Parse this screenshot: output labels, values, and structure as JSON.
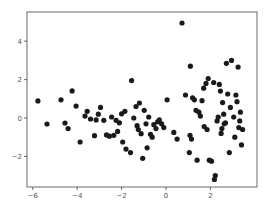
{
  "chart_data": {
    "type": "scatter",
    "title": "",
    "xlabel": "",
    "ylabel": "",
    "xlim": [
      -6.3,
      4.1
    ],
    "ylim": [
      -3.6,
      5.6
    ],
    "xticks": [
      -6,
      -4,
      -2,
      0,
      2
    ],
    "yticks": [
      -2,
      0,
      2,
      4
    ],
    "xtick_labels": [
      "−6",
      "−4",
      "−2",
      "0",
      "2"
    ],
    "ytick_labels": [
      "−2",
      "0",
      "2",
      "4"
    ],
    "grid": false,
    "legend": null,
    "marker_color": "#1a1a1a",
    "points": [
      {
        "x": -5.77,
        "y": 0.89
      },
      {
        "x": -5.36,
        "y": -0.31
      },
      {
        "x": -4.73,
        "y": 0.95
      },
      {
        "x": -4.55,
        "y": -0.26
      },
      {
        "x": -4.41,
        "y": -0.55
      },
      {
        "x": -4.23,
        "y": 1.41
      },
      {
        "x": -4.05,
        "y": 0.62
      },
      {
        "x": -3.87,
        "y": -1.25
      },
      {
        "x": -3.65,
        "y": 0.1
      },
      {
        "x": -3.55,
        "y": 0.35
      },
      {
        "x": -3.4,
        "y": -0.05
      },
      {
        "x": -3.22,
        "y": -0.92
      },
      {
        "x": -3.15,
        "y": -0.1
      },
      {
        "x": -3.05,
        "y": 0.2
      },
      {
        "x": -2.95,
        "y": 0.55
      },
      {
        "x": -2.8,
        "y": -0.12
      },
      {
        "x": -2.68,
        "y": -0.88
      },
      {
        "x": -2.55,
        "y": -0.95
      },
      {
        "x": -2.45,
        "y": 0.05
      },
      {
        "x": -2.35,
        "y": -0.9
      },
      {
        "x": -2.25,
        "y": -0.12
      },
      {
        "x": -2.18,
        "y": -0.7
      },
      {
        "x": -2.1,
        "y": -0.25
      },
      {
        "x": -2.0,
        "y": 0.22
      },
      {
        "x": -1.95,
        "y": -1.25
      },
      {
        "x": -1.85,
        "y": 0.35
      },
      {
        "x": -1.8,
        "y": -1.62
      },
      {
        "x": -1.6,
        "y": -1.8
      },
      {
        "x": -1.55,
        "y": 1.95
      },
      {
        "x": -1.45,
        "y": 0.0
      },
      {
        "x": -1.35,
        "y": 0.6
      },
      {
        "x": -1.3,
        "y": -0.4
      },
      {
        "x": -1.25,
        "y": -0.6
      },
      {
        "x": -1.2,
        "y": 0.78
      },
      {
        "x": -1.12,
        "y": -0.82
      },
      {
        "x": -1.05,
        "y": -2.1
      },
      {
        "x": -0.98,
        "y": 0.4
      },
      {
        "x": -0.9,
        "y": -0.3
      },
      {
        "x": -0.85,
        "y": -1.55
      },
      {
        "x": -0.78,
        "y": 0.05
      },
      {
        "x": -0.7,
        "y": -0.85
      },
      {
        "x": -0.62,
        "y": -1.0
      },
      {
        "x": -0.55,
        "y": -0.35
      },
      {
        "x": -0.45,
        "y": -0.55
      },
      {
        "x": -0.38,
        "y": -0.2
      },
      {
        "x": -0.3,
        "y": -0.1
      },
      {
        "x": -0.2,
        "y": -0.3
      },
      {
        "x": -0.1,
        "y": -0.5
      },
      {
        "x": 0.05,
        "y": 0.95
      },
      {
        "x": 0.35,
        "y": -0.75
      },
      {
        "x": 0.5,
        "y": -1.1
      },
      {
        "x": 0.72,
        "y": 4.95
      },
      {
        "x": 0.88,
        "y": 1.2
      },
      {
        "x": 1.08,
        "y": -0.9
      },
      {
        "x": 1.15,
        "y": -1.1
      },
      {
        "x": 1.4,
        "y": -2.2
      },
      {
        "x": 1.05,
        "y": -1.8
      },
      {
        "x": 1.2,
        "y": 1.05
      },
      {
        "x": 1.28,
        "y": 0.95
      },
      {
        "x": 1.35,
        "y": 0.4
      },
      {
        "x": 1.1,
        "y": 2.7
      },
      {
        "x": 1.48,
        "y": 0.3
      },
      {
        "x": 1.55,
        "y": 0.1
      },
      {
        "x": 1.62,
        "y": 0.9
      },
      {
        "x": 1.7,
        "y": 1.55
      },
      {
        "x": 1.8,
        "y": 1.8
      },
      {
        "x": 1.9,
        "y": 2.05
      },
      {
        "x": 1.72,
        "y": -0.45
      },
      {
        "x": 1.85,
        "y": -0.6
      },
      {
        "x": 1.95,
        "y": -2.2
      },
      {
        "x": 2.05,
        "y": -2.25
      },
      {
        "x": 2.15,
        "y": 1.85
      },
      {
        "x": 2.18,
        "y": -3.2
      },
      {
        "x": 2.22,
        "y": -3.0
      },
      {
        "x": 2.3,
        "y": -0.15
      },
      {
        "x": 2.35,
        "y": 0.05
      },
      {
        "x": 2.4,
        "y": 1.75
      },
      {
        "x": 2.45,
        "y": 1.4
      },
      {
        "x": 2.48,
        "y": -0.8
      },
      {
        "x": 2.52,
        "y": -0.55
      },
      {
        "x": 2.55,
        "y": 0.8
      },
      {
        "x": 2.6,
        "y": 0.2
      },
      {
        "x": 2.62,
        "y": -0.3
      },
      {
        "x": 2.68,
        "y": -0.25
      },
      {
        "x": 2.72,
        "y": 2.85
      },
      {
        "x": 2.78,
        "y": 1.25
      },
      {
        "x": 2.85,
        "y": -1.8
      },
      {
        "x": 2.9,
        "y": 0.55
      },
      {
        "x": 2.95,
        "y": 3.0
      },
      {
        "x": 3.05,
        "y": 0.05
      },
      {
        "x": 3.1,
        "y": -1.0
      },
      {
        "x": 3.15,
        "y": 1.2
      },
      {
        "x": 3.2,
        "y": 0.85
      },
      {
        "x": 3.25,
        "y": 2.65
      },
      {
        "x": 3.28,
        "y": -0.5
      },
      {
        "x": 3.32,
        "y": -0.15
      },
      {
        "x": 3.35,
        "y": 0.3
      },
      {
        "x": 3.4,
        "y": -1.4
      },
      {
        "x": 3.45,
        "y": -0.6
      }
    ]
  }
}
